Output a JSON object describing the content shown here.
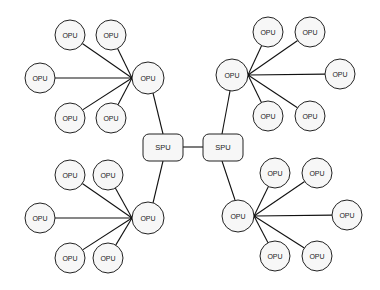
{
  "diagram": {
    "type": "hierarchical-star-network",
    "colors": {
      "node_fill": "#f7f7f7",
      "stroke": "#222222",
      "edge": "#111111",
      "background": "#ffffff"
    },
    "spus": [
      {
        "id": "spu-left",
        "label": "SPU",
        "x": 143,
        "y": 134,
        "w": 40,
        "h": 27
      },
      {
        "id": "spu-right",
        "label": "SPU",
        "x": 203,
        "y": 134,
        "w": 40,
        "h": 27
      }
    ],
    "clusters": [
      {
        "id": "top-left",
        "hub": {
          "label": "OPU",
          "cx": 148,
          "cy": 78,
          "r": 16,
          "anchor": [
            132,
            78
          ]
        },
        "spu": "spu-left",
        "spu_link": [
          [
            153,
            93
          ],
          [
            163,
            134
          ]
        ],
        "leaves": [
          {
            "label": "OPU",
            "cx": 70,
            "cy": 35
          },
          {
            "label": "OPU",
            "cx": 111,
            "cy": 35
          },
          {
            "label": "OPU",
            "cx": 40,
            "cy": 78
          },
          {
            "label": "OPU",
            "cx": 70,
            "cy": 118
          },
          {
            "label": "OPU",
            "cx": 111,
            "cy": 118
          }
        ]
      },
      {
        "id": "top-right",
        "hub": {
          "label": "OPU",
          "cx": 232,
          "cy": 75,
          "r": 16,
          "anchor": [
            248,
            75
          ]
        },
        "spu": "spu-right",
        "spu_link": [
          [
            230,
            91
          ],
          [
            222,
            134
          ]
        ],
        "leaves": [
          {
            "label": "OPU",
            "cx": 268,
            "cy": 32
          },
          {
            "label": "OPU",
            "cx": 310,
            "cy": 32
          },
          {
            "label": "OPU",
            "cx": 340,
            "cy": 74
          },
          {
            "label": "OPU",
            "cx": 268,
            "cy": 116
          },
          {
            "label": "OPU",
            "cx": 310,
            "cy": 116
          }
        ]
      },
      {
        "id": "bottom-left",
        "hub": {
          "label": "OPU",
          "cx": 148,
          "cy": 218,
          "r": 16,
          "anchor": [
            132,
            218
          ]
        },
        "spu": "spu-left",
        "spu_link": [
          [
            163,
            161
          ],
          [
            153,
            203
          ]
        ],
        "leaves": [
          {
            "label": "OPU",
            "cx": 70,
            "cy": 175
          },
          {
            "label": "OPU",
            "cx": 108,
            "cy": 175
          },
          {
            "label": "OPU",
            "cx": 40,
            "cy": 218
          },
          {
            "label": "OPU",
            "cx": 70,
            "cy": 258
          },
          {
            "label": "OPU",
            "cx": 108,
            "cy": 258
          }
        ]
      },
      {
        "id": "bottom-right",
        "hub": {
          "label": "OPU",
          "cx": 238,
          "cy": 216,
          "r": 16,
          "anchor": [
            254,
            216
          ]
        },
        "spu": "spu-right",
        "spu_link": [
          [
            222,
            161
          ],
          [
            235,
            200
          ]
        ],
        "leaves": [
          {
            "label": "OPU",
            "cx": 275,
            "cy": 173
          },
          {
            "label": "OPU",
            "cx": 317,
            "cy": 173
          },
          {
            "label": "OPU",
            "cx": 347,
            "cy": 215
          },
          {
            "label": "OPU",
            "cx": 275,
            "cy": 256
          },
          {
            "label": "OPU",
            "cx": 317,
            "cy": 256
          }
        ]
      }
    ],
    "spu_link": [
      [
        183,
        147
      ],
      [
        203,
        147
      ]
    ],
    "leaf_radius": 15
  }
}
